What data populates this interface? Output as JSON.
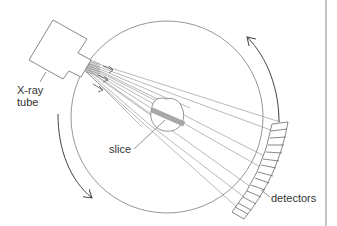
{
  "diagram": {
    "labels": {
      "xray_tube_line1": "X-ray",
      "xray_tube_line2": "tube",
      "slice": "slice",
      "detectors": "detectors"
    },
    "components": [
      "X-ray tube",
      "fan beam",
      "gantry circle",
      "slice (patient cross-section)",
      "detector array",
      "rotation arrows"
    ],
    "colors": {
      "line": "#7a7a7a",
      "arrow": "#444444",
      "text": "#333333",
      "band": "#9a9a9a",
      "border": "#b0b0b0"
    }
  }
}
